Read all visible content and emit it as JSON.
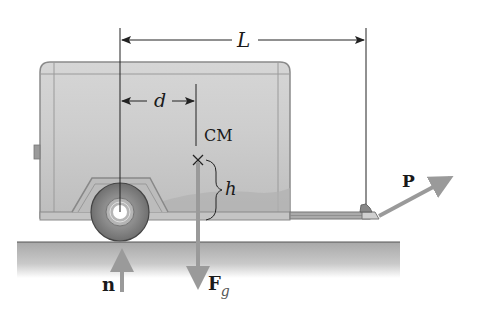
{
  "diagram": {
    "labels": {
      "length": "L",
      "distance": "d",
      "center_of_mass": "CM",
      "height": "h",
      "pull_force": "P",
      "normal_force": "n",
      "gravity_force_main": "F",
      "gravity_force_sub": "g"
    },
    "colors": {
      "trailer_body": "#c8c8c8",
      "trailer_outline": "#8a8a8a",
      "ground": "#b5b5b5",
      "force_arrow": "#9a9a9a",
      "dimension_line": "#222222"
    }
  }
}
